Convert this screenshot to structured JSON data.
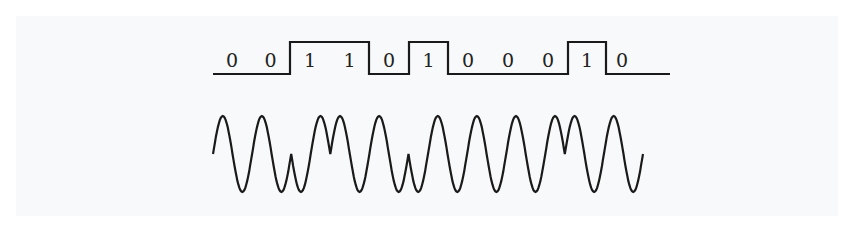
{
  "diagram": {
    "type": "phase-shift-keying",
    "bits": [
      "0",
      "0",
      "1",
      "1",
      "0",
      "1",
      "0",
      "0",
      "0",
      "1",
      "0"
    ],
    "bit_boundaries_x": [
      213,
      251,
      290,
      330,
      369,
      409,
      448,
      488,
      528,
      568,
      606,
      670
    ],
    "signal": {
      "high_y": 42,
      "low_y": 74,
      "stroke": "#1a1a1a"
    },
    "carrier": {
      "center_y": 154,
      "amplitude": 38,
      "x_start": 213,
      "x_end": 643,
      "stroke": "#1a1a1a"
    },
    "colors": {
      "background": "#f8f9fa",
      "line": "#1a1a1a"
    }
  }
}
